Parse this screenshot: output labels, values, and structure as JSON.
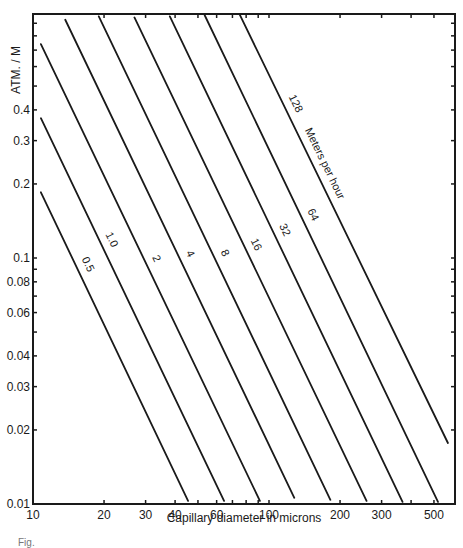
{
  "chart_data": {
    "type": "line",
    "title": "",
    "xlabel": "Capillary diameter in microns",
    "ylabel": "ATM. / M",
    "xscale": "log",
    "yscale": "log",
    "xlim": [
      10,
      600
    ],
    "ylim": [
      0.01,
      1.0
    ],
    "grid": false,
    "legend": "inline labels along lines",
    "series_annotation": "Meters per hour",
    "x_ticks": [
      10,
      20,
      30,
      40,
      60,
      100,
      200,
      300,
      500
    ],
    "x_tick_labels": [
      "10",
      "20",
      "30",
      "40",
      "60",
      "100",
      "200",
      "300",
      "500"
    ],
    "x_minor_ticks": [
      50,
      70,
      80,
      90,
      400
    ],
    "y_ticks": [
      0.01,
      0.02,
      0.03,
      0.04,
      0.06,
      0.08,
      0.1,
      0.2,
      0.3,
      0.4
    ],
    "y_tick_labels": [
      "0.01",
      "0.02",
      "0.03",
      "0.04",
      "0.06",
      "0.08",
      "0.1",
      "0.2",
      "0.3",
      "0.4"
    ],
    "y_minor_ticks": [
      0.05,
      0.07,
      0.09,
      0.5,
      0.6,
      0.7,
      0.8,
      0.9
    ],
    "relation": "pressure gradient ∝ velocity / diameter²",
    "series": [
      {
        "name": "0.5",
        "k": 21.6,
        "x": [
          10.8,
          45.4
        ],
        "y": [
          0.185,
          0.0103
        ]
      },
      {
        "name": "1.0",
        "k": 43,
        "x": [
          10.8,
          64.5
        ],
        "y": [
          0.37,
          0.0103
        ]
      },
      {
        "name": "2",
        "k": 86,
        "x": [
          10.8,
          91.5
        ],
        "y": [
          0.74,
          0.0103
        ]
      },
      {
        "name": "4",
        "k": 173,
        "x": [
          13.7,
          128
        ],
        "y": [
          0.93,
          0.0106
        ]
      },
      {
        "name": "8",
        "k": 346,
        "x": [
          19.0,
          182
        ],
        "y": [
          0.96,
          0.0104
        ]
      },
      {
        "name": "16",
        "k": 691,
        "x": [
          26.9,
          259
        ],
        "y": [
          0.95,
          0.0103
        ]
      },
      {
        "name": "32",
        "k": 1382,
        "x": [
          38.0,
          368
        ],
        "y": [
          0.96,
          0.0102
        ]
      },
      {
        "name": "64",
        "k": 2765,
        "x": [
          53.4,
          520
        ],
        "y": [
          0.97,
          0.0102
        ]
      },
      {
        "name": "128",
        "k": 5530,
        "x": [
          75.0,
          573
        ],
        "y": [
          0.98,
          0.0177
        ]
      }
    ]
  },
  "caption_fragment": "Fig."
}
